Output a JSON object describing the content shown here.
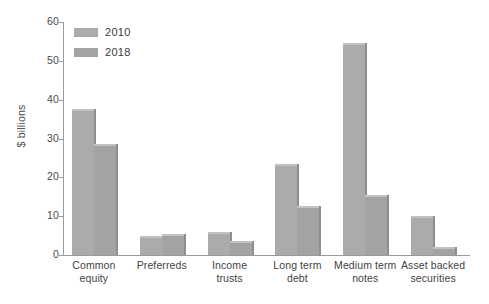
{
  "chart_data": {
    "type": "bar",
    "title": "",
    "xlabel": "",
    "ylabel": "$ billions",
    "ylim": [
      0,
      60
    ],
    "yticks": [
      0,
      10,
      20,
      30,
      40,
      50,
      60
    ],
    "ytick_labels": [
      "0",
      "10",
      "20",
      "30",
      "40",
      "50",
      "60"
    ],
    "grid": false,
    "legend_position": "top-left",
    "categories": [
      "Common equity",
      "Preferreds",
      "Income trusts",
      "Long term debt",
      "Medium term notes",
      "Asset backed securities"
    ],
    "category_lines": [
      [
        "Common",
        "equity"
      ],
      [
        "Preferreds",
        ""
      ],
      [
        "Income",
        "trusts"
      ],
      [
        "Long term",
        "debt"
      ],
      [
        "Medium term",
        "notes"
      ],
      [
        "Asset backed",
        "securities"
      ]
    ],
    "series": [
      {
        "name": "2010",
        "color": "#ababab",
        "values": [
          37,
          4.5,
          5.5,
          23,
          54,
          9.5
        ]
      },
      {
        "name": "2018",
        "color": "#a3a3a3",
        "values": [
          28,
          5,
          3,
          12,
          15,
          1.5
        ]
      }
    ]
  },
  "legend": {
    "items": [
      {
        "label": "2010",
        "color": "#ababab"
      },
      {
        "label": "2018",
        "color": "#a3a3a3"
      }
    ]
  },
  "axis": {
    "y_title": "$ billions"
  }
}
